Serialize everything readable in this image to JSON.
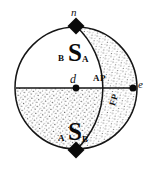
{
  "figure": {
    "background_color": "#ffffff",
    "ink_color": "#111111",
    "stipple_color": "#3a3a3a",
    "geometry": {
      "main_circle": {
        "cx": 76,
        "cy": 88,
        "r": 61
      },
      "offset_arc": {
        "cx": 48,
        "cy": 88,
        "r": 85
      },
      "center_point": {
        "x": 76,
        "y": 88
      },
      "east_point": {
        "x": 133,
        "y": 88
      },
      "north_diamond": {
        "x": 76,
        "y": 26
      },
      "south_diamond": {
        "x": 76,
        "y": 150
      },
      "horizon_line": {
        "x1": 16,
        "y1": 88,
        "x2": 133,
        "y2": 88
      }
    },
    "labels": {
      "north_pole": "n",
      "east_point": "e",
      "center": "d",
      "apogee": "AP",
      "perigee": "FP",
      "upper_symbol": "S",
      "upper_sub_left": "B",
      "upper_sub_right": "A",
      "lower_symbol": "S",
      "lower_sub_left": "A",
      "lower_sub_right": "B"
    },
    "shading": {
      "lower_hemisphere": "stippled",
      "right_lune": "stippled"
    }
  }
}
